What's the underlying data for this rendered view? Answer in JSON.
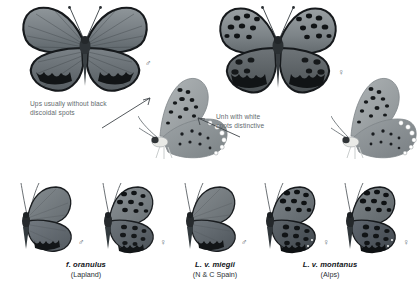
{
  "page": {
    "background": "#ffffff",
    "text_color": "#5f6a6e",
    "caption_color": "#111418"
  },
  "annotations": [
    {
      "id": "ups-note",
      "text": "Ups usually without black\ndiscoidal spots",
      "points_to": "male-underside-left"
    },
    {
      "id": "unh-note",
      "text": "Unh with white\nspots distinctive",
      "points_to": "female-underside-right"
    }
  ],
  "sex_symbols": {
    "male": "♂",
    "female": "♀"
  },
  "top_row": [
    {
      "id": "male-upperside",
      "view": "upperside",
      "sex": "male",
      "sex_symbol": "♂",
      "wing_color": "#6d757a",
      "border_color": "#111316"
    },
    {
      "id": "male-underside",
      "view": "underside",
      "sex": "male",
      "ground_color": "#9aa0a3"
    },
    {
      "id": "female-upperside",
      "view": "upperside",
      "sex": "female",
      "sex_symbol": "♀",
      "wing_color": "#6a7074",
      "border_color": "#111316"
    },
    {
      "id": "female-underside",
      "view": "underside",
      "sex": "female",
      "ground_color": "#9aa0a3"
    }
  ],
  "bottom_row": [
    {
      "id": "oranulus-male",
      "sex": "male",
      "sex_symbol": "♂",
      "group": "oranulus"
    },
    {
      "id": "oranulus-female",
      "sex": "female",
      "sex_symbol": "♀",
      "group": "oranulus"
    },
    {
      "id": "miegii-male",
      "sex": "male",
      "sex_symbol": "♂",
      "group": "miegii"
    },
    {
      "id": "miegii-female",
      "sex": "female",
      "sex_symbol": "♀",
      "group": "miegii"
    },
    {
      "id": "montanus-male",
      "sex": "male",
      "sex_symbol": "♂",
      "group": "montanus"
    },
    {
      "id": "montanus-female",
      "sex": "female",
      "sex_symbol": "♀",
      "group": "montanus"
    }
  ],
  "captions": [
    {
      "id": "caption-oranulus",
      "scientific": "f. oranulus",
      "locality": "(Lapland)"
    },
    {
      "id": "caption-miegii",
      "scientific": "L. v. miegii",
      "locality": "(N & C Spain)"
    },
    {
      "id": "caption-montanus",
      "scientific": "L. v. montanus",
      "locality": "(Alps)"
    }
  ]
}
